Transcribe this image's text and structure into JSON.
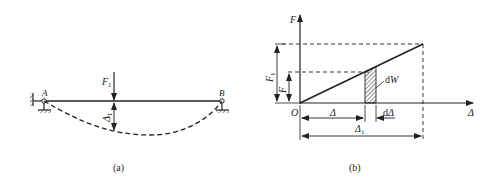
{
  "figure": {
    "panel_a": {
      "caption": "(a)",
      "labels": {
        "support_left": "A",
        "support_right": "B",
        "force": "F",
        "force_sub": "1",
        "deflection": "Δ",
        "deflection_sub": "1"
      }
    },
    "panel_b": {
      "caption": "(b)",
      "labels": {
        "y_axis": "F",
        "x_axis": "Δ",
        "origin": "O",
        "force_total": "F",
        "force_total_sub": "1",
        "force_current": "F",
        "work_element": "dW",
        "displacement": "Δ",
        "displacement_increment": "dΔ",
        "displacement_total": "Δ",
        "displacement_total_sub": "1"
      }
    },
    "colors": {
      "line": "#222222",
      "background": "#ffffff"
    }
  }
}
